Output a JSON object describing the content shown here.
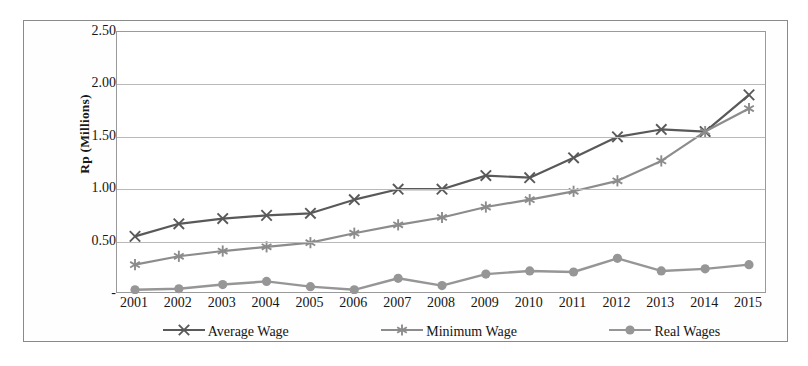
{
  "chart_data": {
    "type": "line",
    "title": "",
    "xlabel": "",
    "ylabel": "Rp (Millions)",
    "categories": [
      "2001",
      "2002",
      "2003",
      "2004",
      "2005",
      "2006",
      "2007",
      "2008",
      "2009",
      "2010",
      "2011",
      "2012",
      "2013",
      "2014",
      "2015"
    ],
    "yticks": [
      "-",
      "0.50",
      "1.00",
      "1.50",
      "2.00",
      "2.50"
    ],
    "ytick_values": [
      0,
      0.5,
      1.0,
      1.5,
      2.0,
      2.5
    ],
    "ylim": [
      0,
      2.5
    ],
    "grid": true,
    "legend_position": "bottom",
    "series": [
      {
        "name": "Average Wage",
        "marker": "x",
        "color": "#595959",
        "values": [
          0.55,
          0.67,
          0.72,
          0.75,
          0.77,
          0.9,
          1.0,
          1.0,
          1.13,
          1.11,
          1.3,
          1.5,
          1.57,
          1.55,
          1.9
        ]
      },
      {
        "name": "Minimum Wage",
        "marker": "asterisk",
        "color": "#8c8c8c",
        "values": [
          0.28,
          0.36,
          0.41,
          0.45,
          0.49,
          0.58,
          0.66,
          0.73,
          0.83,
          0.9,
          0.98,
          1.08,
          1.27,
          1.55,
          1.77
        ]
      },
      {
        "name": "Real Wages",
        "marker": "circle",
        "color": "#969696",
        "values": [
          0.04,
          0.05,
          0.09,
          0.12,
          0.07,
          0.04,
          0.15,
          0.08,
          0.19,
          0.22,
          0.21,
          0.34,
          0.22,
          0.24,
          0.28
        ]
      }
    ]
  },
  "colors": {
    "frame": "#8a8a8a",
    "gridline": "#b9b9b9",
    "text": "#161616",
    "average_wage": "#595959",
    "minimum_wage": "#8c8c8c",
    "real_wages": "#969696"
  }
}
